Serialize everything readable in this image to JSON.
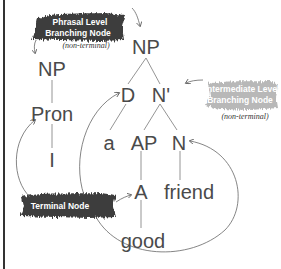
{
  "diagram": {
    "type": "syntax-tree",
    "nodes": {
      "np_root": "NP",
      "np_left": "NP",
      "pron": "Pron",
      "i": "I",
      "d": "D",
      "n_bar": "N'",
      "a_det": "a",
      "ap": "AP",
      "n": "N",
      "adj": "A",
      "friend": "friend",
      "good": "good"
    },
    "annotations": {
      "phrasal": {
        "line1": "Phrasal Level",
        "line2": "Branching Node",
        "note": "(non-terminal)"
      },
      "intermediate": {
        "line1": "Intermediate Level",
        "line2": "Branching Node",
        "note": "(non-terminal)"
      },
      "terminal": {
        "label": "Terminal Node"
      }
    },
    "colors": {
      "node_text": "#4a4a4a",
      "dark_brush": "#3d3d3d",
      "light_brush": "#b5b5b5",
      "lines": "#777777"
    }
  }
}
